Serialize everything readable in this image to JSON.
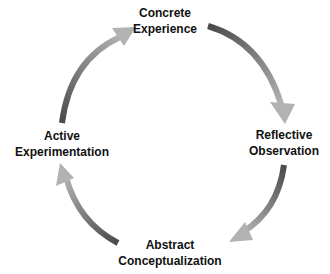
{
  "diagram": {
    "type": "cycle",
    "stages": [
      {
        "id": "concrete-experience",
        "line1": "Concrete",
        "line2": "Experience"
      },
      {
        "id": "reflective-observation",
        "line1": "Reflective",
        "line2": "Observation"
      },
      {
        "id": "abstract-conceptualization",
        "line1": "Abstract",
        "line2": "Conceptualization"
      },
      {
        "id": "active-experimentation",
        "line1": "Active",
        "line2": "Experimentation"
      }
    ],
    "arrows": [
      {
        "from": "concrete-experience",
        "to": "reflective-observation"
      },
      {
        "from": "reflective-observation",
        "to": "abstract-conceptualization"
      },
      {
        "from": "abstract-conceptualization",
        "to": "active-experimentation"
      },
      {
        "from": "active-experimentation",
        "to": "concrete-experience"
      }
    ],
    "colors": {
      "arrow_dark": "#555555",
      "arrow_light": "#b5b5b5",
      "text": "#111111",
      "background": "#ffffff"
    }
  }
}
